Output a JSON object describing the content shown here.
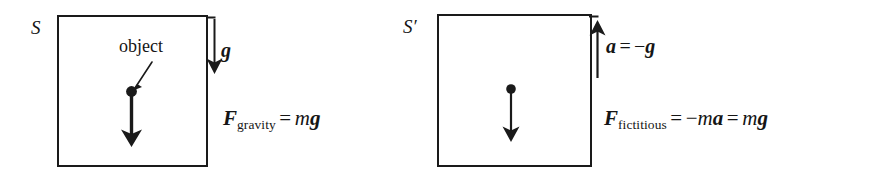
{
  "figure": {
    "background_color": "#ffffff",
    "ink_color": "#151515"
  },
  "panels": [
    {
      "id": "left",
      "frame_label": "S",
      "object_label": "object",
      "field_symbol": "g",
      "field_arrow_direction": "down",
      "object_arrow_direction": "down",
      "equation": {
        "lhs_vector": "F",
        "lhs_subscript": "gravity",
        "relation": "=",
        "rhs_scalar": "m",
        "rhs_vector": "g",
        "plain_text": "F_gravity = mg"
      }
    },
    {
      "id": "right",
      "frame_label": "S′",
      "field_arrow_direction": "up",
      "object_arrow_direction": "down",
      "accel_equation": {
        "lhs_vector": "a",
        "relation": "=",
        "sign": "−",
        "rhs_vector": "g",
        "plain_text": "a = −g"
      },
      "equation": {
        "lhs_vector": "F",
        "lhs_subscript": "fictitious",
        "relation_1": "=",
        "sign": "−",
        "mid_scalar": "m",
        "mid_vector": "a",
        "relation_2": "=",
        "rhs_scalar": "m",
        "rhs_vector": "g",
        "plain_text": "F_fictitious = −ma = mg"
      }
    }
  ]
}
